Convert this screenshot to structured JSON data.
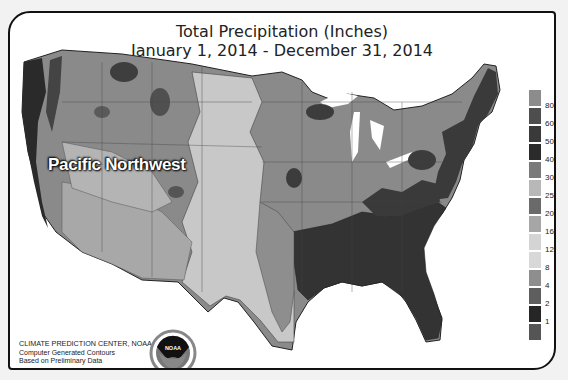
{
  "title": {
    "line1": "Total Precipitation (Inches)",
    "line2": "January 1, 2014 - December 31, 2014"
  },
  "annotation": {
    "region_label": "Pacific Northwest"
  },
  "legend": {
    "unit": "inches",
    "swatches": [
      {
        "color": "#8c8c8c"
      },
      {
        "color": "#4e4e4e"
      },
      {
        "color": "#3a3a3a"
      },
      {
        "color": "#2b2b2b"
      },
      {
        "color": "#7a7a7a"
      },
      {
        "color": "#b8b8b8"
      },
      {
        "color": "#6a6a6a"
      },
      {
        "color": "#a6a6a6"
      },
      {
        "color": "#d4d4d4"
      },
      {
        "color": "#d8d8d8"
      },
      {
        "color": "#8e8e8e"
      },
      {
        "color": "#5e5e5e"
      },
      {
        "color": "#262626"
      },
      {
        "color": "#555555"
      }
    ],
    "labels": [
      "80",
      "60",
      "50",
      "40",
      "30",
      "25",
      "20",
      "16",
      "12",
      "8",
      "4",
      "2",
      "1"
    ]
  },
  "credit": {
    "line1": "CLIMATE PREDICTION CENTER, NOAA",
    "line2": "Computer Generated Contours",
    "line3": "Based on Preliminary Data"
  },
  "logo": {
    "text": "NOAA",
    "icon": "noaa-logo-icon"
  },
  "colors": {
    "frame": "#111111",
    "east_wet": "#333333",
    "midwest": "#7d7d7d",
    "plains_dry": "#c4c4c4",
    "southwest": "#9a9a9a"
  }
}
